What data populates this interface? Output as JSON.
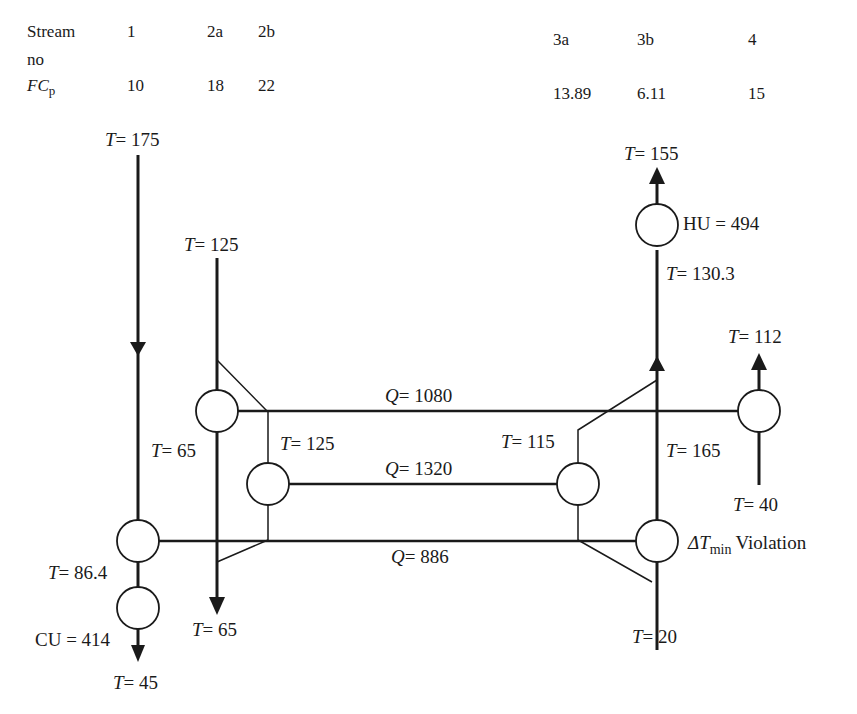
{
  "table": {
    "row1_label": "Stream",
    "row1_label2": "no",
    "row2_label": "FC",
    "row2_sub": "p",
    "streams": [
      "1",
      "2a",
      "2b",
      "3a",
      "3b",
      "4"
    ],
    "fcp": [
      "10",
      "18",
      "22",
      "13.89",
      "6.11",
      "15"
    ]
  },
  "labels": {
    "t175": "= 175",
    "t125_top": "= 125",
    "t65_mid": "= 65",
    "t125_mid": "= 125",
    "t864": "= 86.4",
    "cu": "CU = 414",
    "t45": "= 45",
    "t65_bot": "= 65",
    "t155": "= 155",
    "hu": "HU = 494",
    "t1303": "= 130.3",
    "t112": "= 112",
    "t115": "= 115",
    "t165": "= 165",
    "t40": "= 40",
    "t20": "= 20",
    "q1080": "= 1080",
    "q1320": "= 1320",
    "q886": "= 886",
    "violation_delta": "ΔT",
    "violation_sub": "min",
    "violation_text": "Violation",
    "T": "T",
    "Q": "Q"
  },
  "colors": {
    "line": "#1a1a1a",
    "background": "#ffffff"
  }
}
